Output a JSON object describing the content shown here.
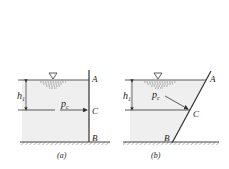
{
  "figure": {
    "panels": [
      {
        "id": "a",
        "caption": "(a)",
        "wall": "vertical",
        "points": {
          "top": "A",
          "middle": "C",
          "bottom": "B"
        },
        "depth_label": "h",
        "depth_subscript": "1",
        "pressure_label": "p",
        "pressure_subscript": "c",
        "free_surface_symbol": "∇"
      },
      {
        "id": "b",
        "caption": "(b)",
        "wall": "inclined",
        "points": {
          "top": "A",
          "middle": "C",
          "bottom": "B"
        },
        "depth_label": "h",
        "depth_subscript": "1",
        "pressure_label": "p",
        "pressure_subscript": "c",
        "free_surface_symbol": "∇"
      }
    ],
    "colors": {
      "water": "#efefef",
      "line": "#333333",
      "hatch": "#777777"
    }
  }
}
